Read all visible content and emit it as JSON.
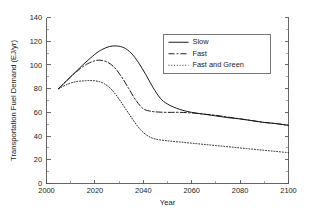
{
  "chart_data": {
    "type": "line",
    "title": "",
    "xlabel": "Year",
    "ylabel": "Transportation Fuel Demand (EJ/yr)",
    "xlim": [
      2000,
      2100
    ],
    "ylim": [
      0,
      140
    ],
    "xticks": [
      2000,
      2020,
      2040,
      2060,
      2080,
      2100
    ],
    "yticks": [
      0,
      20,
      40,
      60,
      80,
      100,
      120,
      140
    ],
    "xtick_labels": [
      "2000",
      "2020",
      "2040",
      "2060",
      "2080",
      "2100"
    ],
    "ytick_labels": [
      "0",
      "20",
      "40",
      "60",
      "80",
      "100",
      "120",
      "140"
    ],
    "x_minor_step": 10,
    "y_minor_step": 10,
    "grid": false,
    "legend_position": "upper right",
    "series": [
      {
        "name": "Slow",
        "style": "solid",
        "x": [
          2005,
          2010,
          2015,
          2020,
          2023,
          2026,
          2029,
          2032,
          2035,
          2038,
          2041,
          2044,
          2047,
          2050,
          2055,
          2060,
          2065,
          2070,
          2075,
          2080,
          2085,
          2090,
          2095,
          2100
        ],
        "y": [
          80,
          90,
          100,
          109,
          113,
          115.5,
          116,
          114.5,
          110,
          102,
          92,
          81,
          72,
          67,
          62.5,
          60,
          58.5,
          57,
          55.5,
          54.5,
          53,
          51.5,
          50.5,
          49
        ]
      },
      {
        "name": "Fast",
        "style": "dashed",
        "x": [
          2005,
          2010,
          2014,
          2017,
          2020,
          2022,
          2025,
          2028,
          2031,
          2034,
          2037,
          2040,
          2043,
          2046,
          2050,
          2055,
          2060,
          2065,
          2070,
          2075,
          2080,
          2085,
          2090,
          2095,
          2100
        ],
        "y": [
          80,
          90,
          97,
          101,
          103.5,
          104,
          102.5,
          98,
          90,
          80,
          70,
          63,
          61,
          60.3,
          60,
          60,
          59.5,
          58.5,
          57.5,
          56,
          54.5,
          53,
          51.5,
          50.5,
          49
        ]
      },
      {
        "name": "Fast and Green",
        "style": "dotted",
        "x": [
          2005,
          2009,
          2012,
          2015,
          2018,
          2021,
          2024,
          2027,
          2030,
          2033,
          2036,
          2039,
          2042,
          2045,
          2050,
          2055,
          2060,
          2065,
          2070,
          2075,
          2080,
          2085,
          2090,
          2095,
          2100
        ],
        "y": [
          80,
          84,
          85.8,
          86.5,
          86.8,
          86.3,
          84,
          79,
          71,
          62,
          53,
          45,
          40,
          37.5,
          36,
          35,
          34,
          33,
          32,
          31,
          30,
          29,
          28,
          27,
          26
        ]
      }
    ]
  },
  "legend": {
    "items": [
      {
        "label": "Slow",
        "style": "solid"
      },
      {
        "label": "Fast",
        "style": "dashed"
      },
      {
        "label": "Fast and Green",
        "style": "dotted"
      }
    ]
  }
}
